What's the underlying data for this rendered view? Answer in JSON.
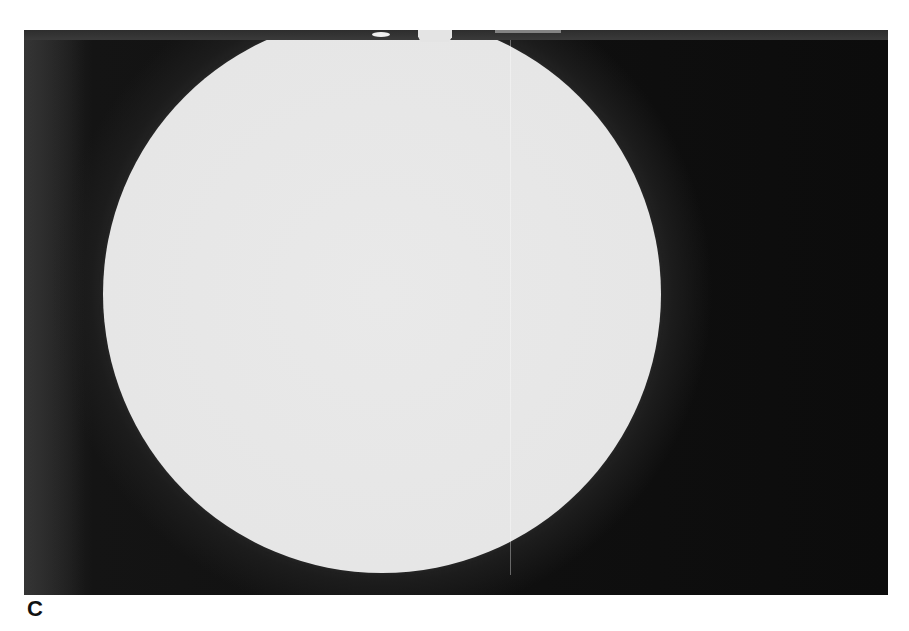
{
  "figure": {
    "panel_label": "C",
    "colors": {
      "background": "#101010",
      "disc": "#e6e6e6",
      "halo": "#3a3a3a",
      "label": "#111111",
      "page": "#ffffff"
    }
  }
}
